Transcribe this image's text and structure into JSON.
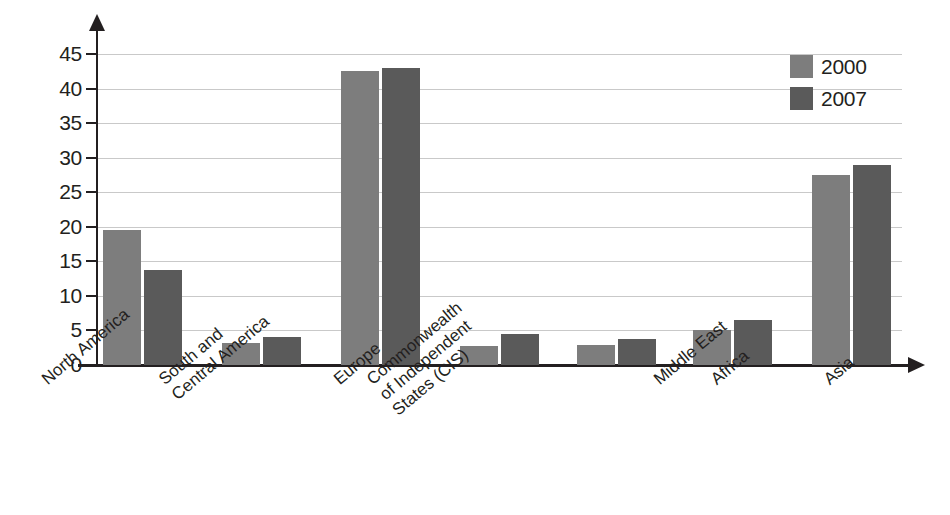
{
  "chart_data": {
    "type": "bar",
    "title": "",
    "subtitle": "",
    "xlabel": "",
    "ylabel": "",
    "ylim": [
      0,
      45
    ],
    "yticks": [
      0,
      5,
      10,
      15,
      20,
      25,
      30,
      35,
      40,
      45
    ],
    "ytick_labels": [
      "0",
      "5",
      "10",
      "15",
      "20",
      "25",
      "30",
      "35",
      "40",
      "45"
    ],
    "grid": true,
    "legend_position": "top-right",
    "categories": [
      "North America",
      "South and Central America",
      "Europe",
      "Commonwealth of Independent States (CIS)",
      "Africa",
      "Middle East",
      "Asia"
    ],
    "category_lines": [
      [
        "North America"
      ],
      [
        "South and",
        "Central America"
      ],
      [
        "Europe"
      ],
      [
        "Commonwealth",
        "of Independent",
        "States (CIS)"
      ],
      [
        "Africa"
      ],
      [
        "Middle East"
      ],
      [
        "Asia"
      ]
    ],
    "series": [
      {
        "name": "2000",
        "color": "#7d7d7d",
        "values": [
          19.5,
          3.2,
          42.5,
          2.7,
          2.9,
          5.0,
          27.5
        ]
      },
      {
        "name": "2007",
        "color": "#5a5a5a",
        "values": [
          13.8,
          4.0,
          43.0,
          4.5,
          3.7,
          6.5,
          29.0
        ]
      }
    ]
  },
  "legend": {
    "items": [
      {
        "label": "2000",
        "color": "#7d7d7d"
      },
      {
        "label": "2007",
        "color": "#5a5a5a"
      }
    ]
  },
  "axes": {
    "y_arrow_icon": "arrow-up-icon",
    "x_arrow_icon": "arrow-right-icon"
  }
}
